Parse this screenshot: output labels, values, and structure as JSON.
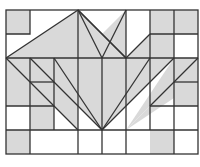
{
  "diagram": {
    "colors": {
      "fill": "#d9d9d9",
      "stroke": "#333333",
      "background": "#ffffff"
    },
    "grid": {
      "x0": 6,
      "y0": 10,
      "cell": 24,
      "cols": 8,
      "rows": 6
    },
    "shaded_polygons": [
      [
        [
          0,
          0
        ],
        [
          1,
          0
        ],
        [
          1,
          1
        ],
        [
          0,
          1
        ]
      ],
      [
        [
          0,
          2
        ],
        [
          3,
          2
        ],
        [
          3,
          0
        ]
      ],
      [
        [
          3,
          0
        ],
        [
          3,
          2
        ],
        [
          5,
          2
        ]
      ],
      [
        [
          3,
          2
        ],
        [
          5,
          2
        ],
        [
          5,
          0
        ]
      ],
      [
        [
          5,
          2
        ],
        [
          7,
          2
        ],
        [
          7,
          0
        ]
      ],
      [
        [
          6,
          1
        ],
        [
          7,
          1
        ],
        [
          7,
          0
        ],
        [
          6,
          0
        ]
      ],
      [
        [
          7,
          0
        ],
        [
          8,
          0
        ],
        [
          8,
          1
        ],
        [
          7,
          1
        ]
      ],
      [
        [
          6,
          2
        ],
        [
          7,
          2
        ],
        [
          7,
          1
        ],
        [
          6,
          1
        ]
      ],
      [
        [
          0,
          2
        ],
        [
          1,
          2
        ],
        [
          1,
          4
        ],
        [
          0,
          4
        ]
      ],
      [
        [
          0,
          2
        ],
        [
          3,
          5
        ],
        [
          3,
          4
        ],
        [
          1,
          2
        ]
      ],
      [
        [
          1,
          3
        ],
        [
          2,
          3
        ],
        [
          2,
          4
        ],
        [
          1,
          4
        ]
      ],
      [
        [
          1,
          2
        ],
        [
          4,
          2
        ],
        [
          4,
          5
        ]
      ],
      [
        [
          4,
          5
        ],
        [
          4,
          2
        ],
        [
          7,
          2
        ]
      ],
      [
        [
          7,
          2
        ],
        [
          8,
          2
        ],
        [
          5,
          5
        ]
      ],
      [
        [
          5,
          5
        ],
        [
          8,
          2
        ],
        [
          8,
          3
        ]
      ],
      [
        [
          7,
          3
        ],
        [
          8,
          3
        ],
        [
          8,
          4
        ],
        [
          7,
          4
        ]
      ],
      [
        [
          1,
          4
        ],
        [
          2,
          4
        ],
        [
          2,
          5
        ],
        [
          1,
          5
        ]
      ],
      [
        [
          0,
          5
        ],
        [
          1,
          5
        ],
        [
          1,
          6
        ],
        [
          0,
          6
        ]
      ],
      [
        [
          6,
          5
        ],
        [
          7,
          5
        ],
        [
          7,
          6
        ],
        [
          6,
          6
        ]
      ]
    ]
  }
}
